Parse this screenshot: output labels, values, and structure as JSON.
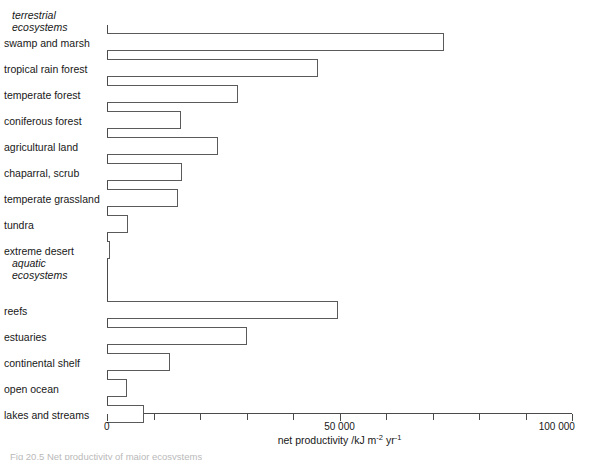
{
  "figure": {
    "caption_clipped": "Fig 20.5 Net productivity of major ecosystems"
  },
  "axis": {
    "title_text": "net productivity /kJ m",
    "title_sup1": "-2",
    "title_mid": " yr",
    "title_sup2": "-1",
    "tick_labels": [
      "0",
      "50 000",
      "100 000"
    ],
    "tick_values": [
      0,
      50000,
      100000
    ],
    "minor_tick_values": [
      10000,
      20000,
      30000,
      40000,
      60000,
      70000,
      80000,
      90000
    ]
  },
  "groups": [
    {
      "name": "terrestrial-ecosystems",
      "line1": "terrestrial",
      "line2": "ecosystems"
    },
    {
      "name": "aquatic-ecosystems",
      "line1": "aquatic",
      "line2": "ecosystems"
    }
  ],
  "chart_data": {
    "type": "bar",
    "orientation": "horizontal",
    "title": "",
    "xlabel": "net productivity /kJ m-2 yr-1",
    "ylabel": "",
    "xlim": [
      0,
      100000
    ],
    "grid": false,
    "legend": "none",
    "groups": [
      "terrestrial ecosystems",
      "aquatic ecosystems"
    ],
    "categories": [
      "swamp and marsh",
      "tropical rain forest",
      "temperate forest",
      "coniferous forest",
      "agricultural land",
      "chaparral, scrub",
      "temperate grassland",
      "tundra",
      "extreme desert",
      "reefs",
      "estuaries",
      "continental shelf",
      "open ocean",
      "lakes and streams"
    ],
    "values": [
      72500,
      45400,
      28200,
      15900,
      23900,
      16100,
      15300,
      4500,
      700,
      49700,
      30100,
      13500,
      4300,
      8000
    ],
    "series": [
      {
        "name": "net productivity",
        "values": [
          72500,
          45400,
          28200,
          15900,
          23900,
          16100,
          15300,
          4500,
          700,
          49700,
          30100,
          13500,
          4300,
          8000
        ]
      }
    ],
    "bars": [
      {
        "label": "swamp and marsh",
        "value": 72500,
        "group": "terrestrial ecosystems"
      },
      {
        "label": "tropical rain forest",
        "value": 45400,
        "group": "terrestrial ecosystems"
      },
      {
        "label": "temperate forest",
        "value": 28200,
        "group": "terrestrial ecosystems"
      },
      {
        "label": "coniferous forest",
        "value": 15900,
        "group": "terrestrial ecosystems"
      },
      {
        "label": "agricultural land",
        "value": 23900,
        "group": "terrestrial ecosystems"
      },
      {
        "label": "chaparral, scrub",
        "value": 16100,
        "group": "terrestrial ecosystems"
      },
      {
        "label": "temperate grassland",
        "value": 15300,
        "group": "terrestrial ecosystems"
      },
      {
        "label": "tundra",
        "value": 4500,
        "group": "terrestrial ecosystems"
      },
      {
        "label": "extreme desert",
        "value": 700,
        "group": "terrestrial ecosystems"
      },
      {
        "label": "reefs",
        "value": 49700,
        "group": "aquatic ecosystems"
      },
      {
        "label": "estuaries",
        "value": 30100,
        "group": "aquatic ecosystems"
      },
      {
        "label": "continental shelf",
        "value": 13500,
        "group": "aquatic ecosystems"
      },
      {
        "label": "open ocean",
        "value": 4300,
        "group": "aquatic ecosystems"
      },
      {
        "label": "lakes and streams",
        "value": 8000,
        "group": "aquatic ecosystems"
      }
    ]
  },
  "colors": {
    "background": "#ffffff",
    "bar_fill": "#ffffff",
    "bar_stroke": "#5a5a5a",
    "axis": "#4a4a4a",
    "text": "#181818"
  }
}
